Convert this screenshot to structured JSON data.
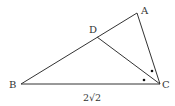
{
  "figure": {
    "type": "triangle",
    "colors": {
      "stroke": "#333333",
      "background": "#ffffff"
    },
    "points": {
      "A": {
        "label": "A",
        "x": 137,
        "y": 13
      },
      "B": {
        "label": "B",
        "x": 21,
        "y": 84
      },
      "C": {
        "label": "C",
        "x": 160,
        "y": 84
      },
      "D": {
        "label": "D",
        "x": 97,
        "y": 37
      }
    },
    "segments": [
      "AB",
      "BC",
      "CA",
      "CD"
    ],
    "side_labels": {
      "BC": "2√2"
    },
    "angle_marks": [
      {
        "description": "angle ACD marked with dot",
        "x": 152,
        "y": 71
      },
      {
        "description": "angle DCB marked with dot",
        "x": 144,
        "y": 80
      }
    ]
  }
}
